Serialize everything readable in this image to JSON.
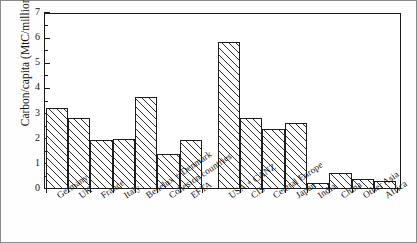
{
  "chart_data": {
    "type": "bar",
    "title": "",
    "xlabel": "",
    "ylabel": "Carbon/capita (MtC/million)",
    "ylim": [
      0,
      7
    ],
    "ytick_labels": [
      "0",
      "1",
      "2",
      "3",
      "4",
      "5",
      "6",
      "7"
    ],
    "ytick_values": [
      0,
      1,
      2,
      3,
      4,
      5,
      6,
      7
    ],
    "minor_tick_step": 0.5,
    "grid": false,
    "legend": null,
    "bar_fill": "white-diagonal-hatch",
    "bar_edge_color": "#1d1d1d",
    "group_gap_after_index": 6,
    "categories": [
      "Germany",
      "UK",
      "France",
      "Italy",
      "Benelux + Denmark",
      "Cohesion countries",
      "EFTA",
      "USA + CANZ",
      "CIS",
      "Central Europe",
      "Japan",
      "India",
      "China",
      "Other Asia",
      "Africa"
    ],
    "values": [
      3.22,
      2.82,
      1.93,
      2.0,
      3.65,
      1.4,
      1.95,
      5.85,
      2.82,
      2.37,
      2.63,
      0.22,
      0.63,
      0.4,
      0.3
    ]
  }
}
